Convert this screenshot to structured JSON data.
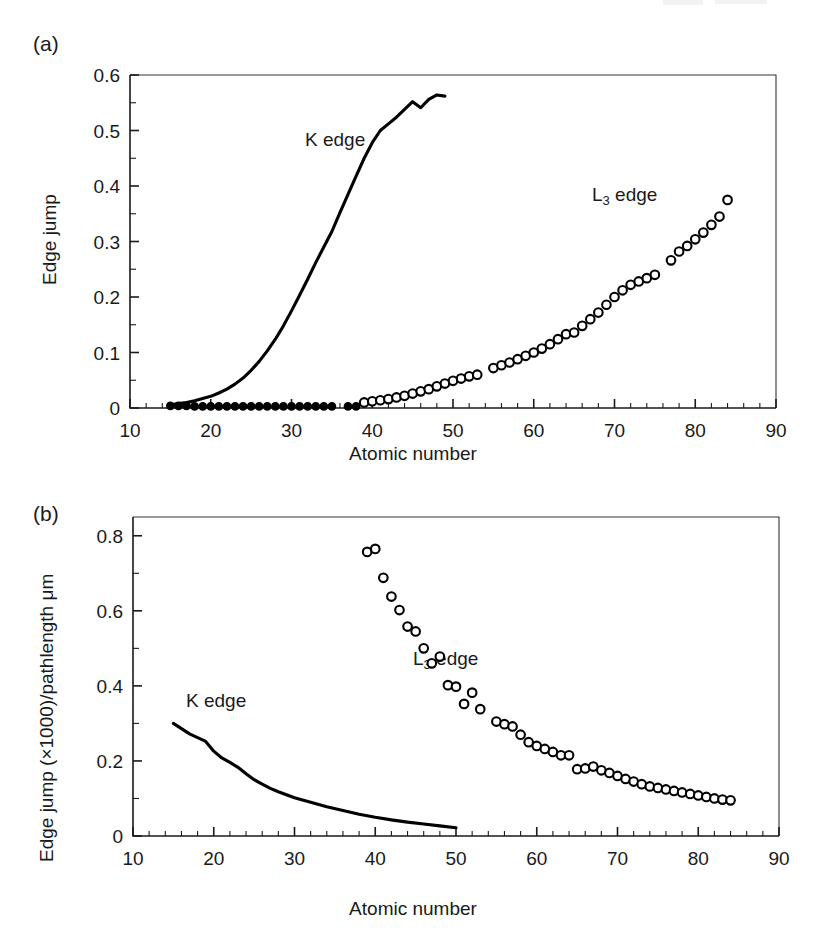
{
  "figure": {
    "panels": [
      {
        "tag": "(a)",
        "xlabel": "Atomic number",
        "ylabel": "Edge jump",
        "series_labels": [
          {
            "text": "K edge",
            "sub": ""
          },
          {
            "text": "L",
            "sub": "3",
            "tail": " edge"
          }
        ]
      },
      {
        "tag": "(b)",
        "xlabel": "Atomic number",
        "ylabel": "Edge jump (×1000)/pathlength μm",
        "series_labels": [
          {
            "text": "K edge",
            "sub": ""
          },
          {
            "text": "L",
            "sub": "3",
            "tail": " edge"
          }
        ]
      }
    ]
  },
  "labels": {
    "panel_a_tag": "(a)",
    "panel_b_tag": "(b)",
    "panel_a_ylabel": "Edge jump",
    "panel_b_ylabel": "Edge jump (×1000)/pathlength μm",
    "xlabel": "Atomic number",
    "k_edge": "K edge",
    "l3_edge_main": "L",
    "l3_edge_sub": "3",
    "l3_edge_tail": " edge"
  },
  "chart_data": [
    {
      "type": "line",
      "panel": "(a)",
      "title": "",
      "xlabel": "Atomic number",
      "ylabel": "Edge jump",
      "xlim": [
        10,
        90
      ],
      "ylim": [
        0,
        0.6
      ],
      "xticks": [
        10,
        20,
        30,
        40,
        50,
        60,
        70,
        80,
        90
      ],
      "xtick_labels": [
        "10",
        "20",
        "30",
        "40",
        "50",
        "60",
        "70",
        "80",
        "90"
      ],
      "xminor_step": 2,
      "yticks": [
        0,
        0.1,
        0.2,
        0.3,
        0.4,
        0.5,
        0.6
      ],
      "ytick_labels": [
        "0",
        "0.1",
        "0.2",
        "0.3",
        "0.4",
        "0.5",
        "0.6"
      ],
      "yminor_step": 0.05,
      "grid": false,
      "legend": "inline-annotations",
      "series": [
        {
          "name": "K edge",
          "marker": "none",
          "style": "solid-line",
          "x": [
            15,
            16,
            17,
            18,
            19,
            20,
            21,
            22,
            23,
            24,
            25,
            26,
            27,
            28,
            29,
            30,
            31,
            32,
            33,
            34,
            35,
            36,
            37,
            38,
            39,
            40,
            41,
            42,
            43,
            44,
            45,
            46,
            47,
            48,
            49
          ],
          "y": [
            0.006,
            0.008,
            0.01,
            0.013,
            0.017,
            0.021,
            0.027,
            0.034,
            0.043,
            0.054,
            0.068,
            0.084,
            0.103,
            0.124,
            0.148,
            0.175,
            0.203,
            0.232,
            0.262,
            0.29,
            0.318,
            0.352,
            0.385,
            0.418,
            0.45,
            0.478,
            0.5,
            0.512,
            0.524,
            0.538,
            0.552,
            0.541,
            0.556,
            0.564,
            0.562
          ]
        },
        {
          "name": "K edge baseline markers",
          "marker": "filled-circle",
          "style": "markers",
          "x": [
            15,
            16,
            17,
            18,
            19,
            20,
            21,
            22,
            23,
            24,
            25,
            26,
            27,
            28,
            29,
            30,
            31,
            32,
            33,
            34,
            35,
            37,
            38
          ],
          "y": [
            0.004,
            0.004,
            0.004,
            0.003,
            0.003,
            0.003,
            0.003,
            0.003,
            0.003,
            0.003,
            0.003,
            0.003,
            0.003,
            0.003,
            0.003,
            0.003,
            0.003,
            0.003,
            0.003,
            0.003,
            0.003,
            0.003,
            0.003
          ]
        },
        {
          "name": "L3 edge",
          "marker": "open-circle",
          "style": "markers",
          "x": [
            39,
            40,
            41,
            42,
            43,
            44,
            45,
            46,
            47,
            48,
            49,
            50,
            51,
            52,
            53,
            55,
            56,
            57,
            58,
            59,
            60,
            61,
            62,
            63,
            64,
            65,
            66,
            67,
            68,
            69,
            70,
            71,
            72,
            73,
            74,
            75,
            77,
            78,
            79,
            80,
            81,
            82,
            83,
            84
          ],
          "y": [
            0.01,
            0.012,
            0.014,
            0.016,
            0.019,
            0.022,
            0.026,
            0.03,
            0.034,
            0.039,
            0.044,
            0.049,
            0.053,
            0.057,
            0.06,
            0.072,
            0.077,
            0.082,
            0.088,
            0.094,
            0.1,
            0.107,
            0.115,
            0.124,
            0.133,
            0.136,
            0.148,
            0.16,
            0.172,
            0.186,
            0.2,
            0.212,
            0.222,
            0.228,
            0.234,
            0.24,
            0.266,
            0.282,
            0.292,
            0.304,
            0.316,
            0.33,
            0.345,
            0.375
          ]
        }
      ]
    },
    {
      "type": "line",
      "panel": "(b)",
      "title": "",
      "xlabel": "Atomic number",
      "ylabel": "Edge jump (×1000)/pathlength μm",
      "xlim": [
        10,
        90
      ],
      "ylim": [
        0,
        0.85
      ],
      "xticks": [
        10,
        20,
        30,
        40,
        50,
        60,
        70,
        80,
        90
      ],
      "xtick_labels": [
        "10",
        "20",
        "30",
        "40",
        "50",
        "60",
        "70",
        "80",
        "90"
      ],
      "xminor_step": 2,
      "yticks": [
        0,
        0.2,
        0.4,
        0.6,
        0.8
      ],
      "ytick_labels": [
        "0",
        "0.2",
        "0.4",
        "0.6",
        "0.8"
      ],
      "yminor_step": 0.1,
      "grid": false,
      "legend": "inline-annotations",
      "series": [
        {
          "name": "K edge",
          "marker": "none",
          "style": "solid-line",
          "x": [
            15,
            16,
            17,
            18,
            19,
            20,
            21,
            22,
            23,
            24,
            25,
            26,
            27,
            28,
            29,
            30,
            32,
            34,
            36,
            38,
            40,
            42,
            44,
            46,
            48,
            50
          ],
          "y": [
            0.3,
            0.286,
            0.272,
            0.262,
            0.252,
            0.226,
            0.208,
            0.196,
            0.183,
            0.166,
            0.15,
            0.138,
            0.127,
            0.118,
            0.11,
            0.102,
            0.09,
            0.078,
            0.068,
            0.058,
            0.05,
            0.043,
            0.037,
            0.032,
            0.027,
            0.022
          ]
        },
        {
          "name": "L3 edge",
          "marker": "open-circle",
          "style": "markers",
          "x": [
            39,
            40,
            41,
            42,
            43,
            44,
            45,
            46,
            47,
            48,
            49,
            50,
            51,
            52,
            53,
            55,
            56,
            57,
            58,
            59,
            60,
            61,
            62,
            63,
            64,
            65,
            66,
            67,
            68,
            69,
            70,
            71,
            72,
            73,
            74,
            75,
            76,
            77,
            78,
            79,
            80,
            81,
            82,
            83,
            84
          ],
          "y": [
            0.757,
            0.765,
            0.688,
            0.638,
            0.602,
            0.558,
            0.545,
            0.5,
            0.46,
            0.478,
            0.402,
            0.398,
            0.352,
            0.382,
            0.338,
            0.305,
            0.298,
            0.292,
            0.27,
            0.25,
            0.24,
            0.232,
            0.224,
            0.215,
            0.215,
            0.178,
            0.18,
            0.185,
            0.175,
            0.168,
            0.16,
            0.152,
            0.145,
            0.138,
            0.132,
            0.128,
            0.124,
            0.12,
            0.116,
            0.112,
            0.108,
            0.104,
            0.1,
            0.097,
            0.095
          ]
        }
      ]
    }
  ]
}
